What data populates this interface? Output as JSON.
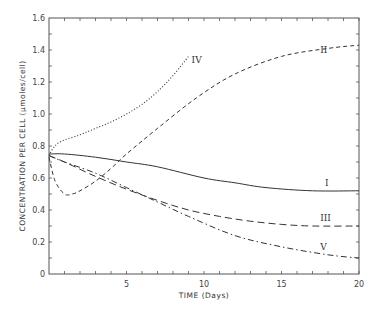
{
  "chart_data": {
    "type": "line",
    "title": "",
    "xlabel": "TIME (Days)",
    "ylabel": "CONCENTRATION PER CELL (μmoles/cell)",
    "xlim": [
      0,
      20
    ],
    "ylim": [
      0,
      1.6
    ],
    "x_ticks": [
      5,
      10,
      15,
      20
    ],
    "y_ticks": [
      0,
      0.2,
      0.4,
      0.6,
      0.8,
      1.0,
      1.2,
      1.4,
      1.6
    ],
    "y_tick_labels": [
      "0",
      "0.2",
      "0.4",
      "0.6",
      "0.8",
      "1.0",
      "1.2",
      "1.4",
      "1.6"
    ],
    "grid": false,
    "legend": "inline labels (roman numerals)",
    "series": [
      {
        "name": "I",
        "style": "solid",
        "x": [
          0,
          1,
          3,
          5,
          7,
          10,
          12,
          14,
          17,
          20
        ],
        "y": [
          0.75,
          0.75,
          0.73,
          0.7,
          0.67,
          0.6,
          0.57,
          0.54,
          0.52,
          0.52
        ],
        "label_pos": [
          17.8,
          0.55
        ]
      },
      {
        "name": "II",
        "style": "dashed",
        "x": [
          0,
          0.4,
          1,
          1.5,
          2,
          3,
          4,
          5,
          7,
          9.5,
          12,
          15,
          18,
          20
        ],
        "y": [
          0.73,
          0.58,
          0.5,
          0.5,
          0.52,
          0.58,
          0.66,
          0.75,
          0.91,
          1.1,
          1.25,
          1.36,
          1.41,
          1.43
        ],
        "label_pos": [
          17.5,
          1.38
        ]
      },
      {
        "name": "III",
        "style": "longdash",
        "x": [
          0,
          1,
          3,
          5,
          7,
          9,
          11,
          13,
          15,
          17,
          20
        ],
        "y": [
          0.74,
          0.7,
          0.61,
          0.53,
          0.46,
          0.4,
          0.36,
          0.33,
          0.31,
          0.3,
          0.3
        ],
        "label_pos": [
          17.5,
          0.33
        ]
      },
      {
        "name": "IV",
        "style": "dotted",
        "x": [
          0,
          0.3,
          0.8,
          2,
          3,
          4,
          5,
          6,
          7,
          8,
          9
        ],
        "y": [
          0.74,
          0.79,
          0.83,
          0.87,
          0.91,
          0.95,
          1.0,
          1.06,
          1.14,
          1.24,
          1.36
        ],
        "label_pos": [
          9.2,
          1.32
        ]
      },
      {
        "name": "V",
        "style": "dashdot",
        "x": [
          0,
          1,
          3,
          5,
          7,
          9,
          12,
          15,
          18,
          20
        ],
        "y": [
          0.74,
          0.7,
          0.63,
          0.54,
          0.45,
          0.36,
          0.24,
          0.17,
          0.12,
          0.1
        ],
        "label_pos": [
          17.5,
          0.15
        ]
      }
    ]
  },
  "labels": {
    "xlabel": "TIME (Days)",
    "ylabel": "CONCENTRATION PER CELL (μmoles/cell)"
  },
  "colors": {
    "ink": "#333333",
    "axis": "#555555",
    "background": "#ffffff"
  }
}
